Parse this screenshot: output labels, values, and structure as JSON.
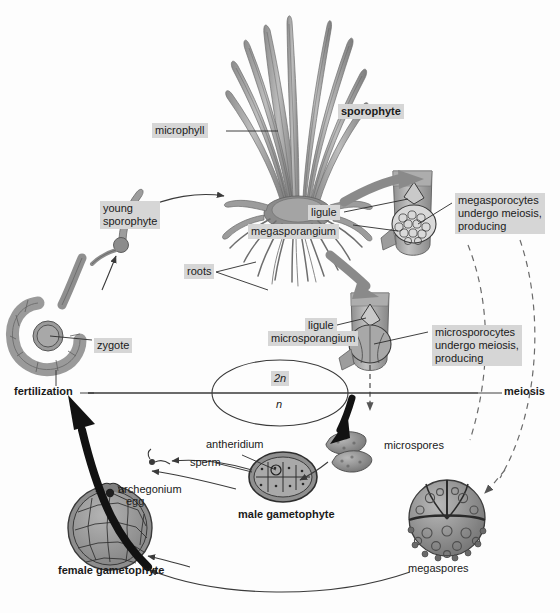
{
  "figure": {
    "background_color": "#fdfdfd",
    "label_highlight_color": "#d6d6d6",
    "ink_color": "#1a1a1a",
    "tissue_fill": "#9a9a9a"
  },
  "labels": {
    "microphyll": "microphyll",
    "sporophyte": "sporophyte",
    "young_sporophyte": "young\nsporophyte",
    "roots": "roots",
    "zygote": "zygote",
    "fertilization": "fertilization",
    "meiosis": "meiosis",
    "ligule_upper": "ligule",
    "megasporangium": "megasporangium",
    "megasporocytes": "megasporocytes\nundergo meiosis,\nproducing",
    "ligule_lower": "ligule",
    "microsporangium": "microsporangium",
    "microsporocytes": "microsporocytes\nundergo meiosis,\nproducing",
    "ploidy_diploid": "2n",
    "ploidy_haploid": "n",
    "antheridium": "antheridium",
    "sperm": "sperm",
    "male_gametophyte": "male gametophyte",
    "archegonium": "archegonium",
    "egg": "egg",
    "female_gametophyte": "female gametophyte",
    "microspores": "microspores",
    "megaspores": "megaspores"
  }
}
